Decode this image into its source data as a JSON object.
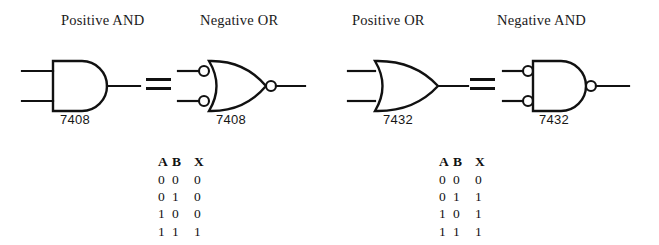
{
  "diagram": {
    "background_color": "#ffffff",
    "line_color": "#111111"
  },
  "groups": [
    {
      "id": "and-group",
      "left_gate": {
        "label": "Positive AND",
        "part_number": "7408",
        "shape": "and",
        "input_bubbles": false,
        "output_bubble": false
      },
      "equals": "=",
      "right_gate": {
        "label": "Negative OR",
        "part_number": "7408",
        "shape": "or",
        "input_bubbles": true,
        "output_bubble": true
      },
      "truth_table": {
        "headers": [
          "A",
          "B",
          "X"
        ],
        "rows": [
          [
            "0",
            "0",
            "0"
          ],
          [
            "0",
            "1",
            "0"
          ],
          [
            "1",
            "0",
            "0"
          ],
          [
            "1",
            "1",
            "1"
          ]
        ]
      }
    },
    {
      "id": "or-group",
      "left_gate": {
        "label": "Positive OR",
        "part_number": "7432",
        "shape": "or",
        "input_bubbles": false,
        "output_bubble": false
      },
      "equals": "=",
      "right_gate": {
        "label": "Negative AND",
        "part_number": "7432",
        "shape": "and",
        "input_bubbles": true,
        "output_bubble": true
      },
      "truth_table": {
        "headers": [
          "A",
          "B",
          "X"
        ],
        "rows": [
          [
            "0",
            "0",
            "0"
          ],
          [
            "0",
            "1",
            "1"
          ],
          [
            "1",
            "0",
            "1"
          ],
          [
            "1",
            "1",
            "1"
          ]
        ]
      }
    }
  ]
}
